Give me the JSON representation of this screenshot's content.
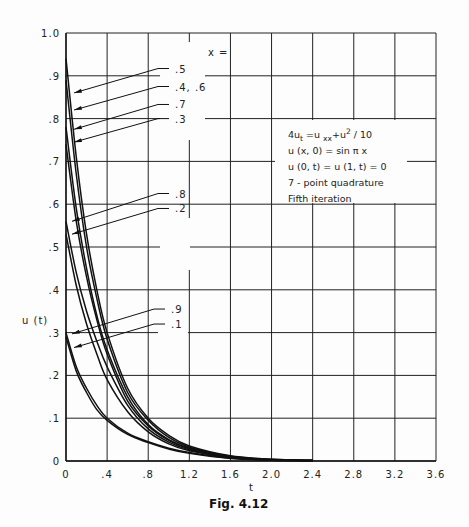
{
  "chart_data": {
    "type": "line",
    "title": "",
    "caption": "Fig. 4.12",
    "xlabel": "t",
    "ylabel": "u (t)",
    "xlim": [
      0,
      3.6
    ],
    "ylim": [
      0,
      1.0
    ],
    "grid": true,
    "x_ticks": [
      "0",
      ".4",
      ".8",
      "1.2",
      "1.6",
      "2.0",
      "2.4",
      "2.8",
      "3.2",
      "3.6"
    ],
    "y_ticks": [
      "0",
      ".1",
      ".2",
      ".3",
      ".4",
      ".5",
      ".6",
      ".7",
      ".8",
      ".9",
      "1.0"
    ],
    "legend_header": "x =",
    "annotation": [
      "4u_t = u_xx + u^2 / 10",
      "u (x, 0) = sin π x",
      "u (0, t) = u (1, t) = 0",
      "7 - point quadrature",
      "Fifth iteration"
    ],
    "x": [
      0,
      0.1,
      0.2,
      0.3,
      0.4,
      0.6,
      0.8,
      1.0,
      1.2,
      1.6,
      2.0,
      2.4
    ],
    "series": [
      {
        "name": ".5",
        "values": [
          0.94,
          0.71,
          0.53,
          0.4,
          0.3,
          0.17,
          0.1,
          0.06,
          0.035,
          0.012,
          0.004,
          0.001
        ]
      },
      {
        "name": ".4, .6",
        "values": [
          0.89,
          0.67,
          0.5,
          0.38,
          0.285,
          0.16,
          0.095,
          0.055,
          0.032,
          0.011,
          0.004,
          0.001
        ]
      },
      {
        "name": ".7",
        "values": [
          0.78,
          0.59,
          0.45,
          0.34,
          0.26,
          0.15,
          0.085,
          0.05,
          0.03,
          0.01,
          0.003,
          0.001
        ]
      },
      {
        "name": ".3",
        "values": [
          0.74,
          0.56,
          0.43,
          0.33,
          0.25,
          0.14,
          0.082,
          0.048,
          0.028,
          0.01,
          0.003,
          0.001
        ]
      },
      {
        "name": ".8",
        "values": [
          0.56,
          0.44,
          0.35,
          0.28,
          0.22,
          0.13,
          0.075,
          0.044,
          0.026,
          0.009,
          0.003,
          0.001
        ]
      },
      {
        "name": ".2",
        "values": [
          0.53,
          0.41,
          0.32,
          0.25,
          0.19,
          0.115,
          0.068,
          0.04,
          0.024,
          0.008,
          0.003,
          0.001
        ]
      },
      {
        "name": ".9",
        "values": [
          0.3,
          0.22,
          0.17,
          0.13,
          0.1,
          0.065,
          0.045,
          0.03,
          0.02,
          0.007,
          0.002,
          0.001
        ]
      },
      {
        "name": ".1",
        "values": [
          0.29,
          0.21,
          0.16,
          0.12,
          0.095,
          0.062,
          0.043,
          0.028,
          0.018,
          0.006,
          0.002,
          0.001
        ]
      }
    ],
    "pointer_labels": [
      {
        "text": ".5",
        "label_y": 0.917,
        "target_t": 0.02,
        "target_u": 0.86
      },
      {
        "text": ".4, .6",
        "label_y": 0.875,
        "target_t": 0.02,
        "target_u": 0.82
      },
      {
        "text": ".7",
        "label_y": 0.833,
        "target_t": 0.02,
        "target_u": 0.775
      },
      {
        "text": ".3",
        "label_y": 0.8,
        "target_t": 0.02,
        "target_u": 0.745
      },
      {
        "text": ".8",
        "label_y": 0.625,
        "target_t": 0.0,
        "target_u": 0.56
      },
      {
        "text": ".2",
        "label_y": 0.59,
        "target_t": 0.0,
        "target_u": 0.53
      },
      {
        "text": ".9",
        "label_y": 0.355,
        "target_t": 0.0,
        "target_u": 0.297
      },
      {
        "text": ".1",
        "label_y": 0.32,
        "target_t": 0.02,
        "target_u": 0.265
      }
    ]
  }
}
